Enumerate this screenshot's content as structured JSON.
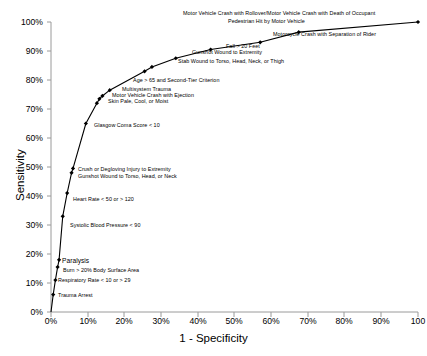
{
  "chart_data": {
    "type": "line",
    "title": "",
    "xlabel": "1 - Specificity",
    "ylabel": "Sensitivity",
    "xlim": [
      0,
      100
    ],
    "ylim": [
      0,
      100
    ],
    "grid": false,
    "legend": "none",
    "xticklabels": [
      "0%",
      "10%",
      "20%",
      "30%",
      "40%",
      "50%",
      "60%",
      "70%",
      "80%",
      "90%",
      "100"
    ],
    "yticklabels": [
      "0%",
      "10%",
      "20%",
      "30%",
      "40%",
      "50%",
      "60%",
      "70%",
      "80%",
      "90%",
      "100%"
    ],
    "series": [
      {
        "name": "ROC curve",
        "marker": "filled-diamond",
        "color": "#000000",
        "points": [
          {
            "x": 0.0,
            "y": 0.0,
            "label": ""
          },
          {
            "x": 0.6,
            "y": 6.0,
            "label": "Trauma Arrest"
          },
          {
            "x": 1.2,
            "y": 11.0,
            "label": "Respiratory Rate < 10 or > 29"
          },
          {
            "x": 1.8,
            "y": 15.5,
            "label": "Burn > 20% Body Surface Area"
          },
          {
            "x": 2.2,
            "y": 18.0,
            "label": "Paralysis"
          },
          {
            "x": 3.2,
            "y": 33.0,
            "label": "Systolic Blood Pressure < 90"
          },
          {
            "x": 4.4,
            "y": 41.0,
            "label": "Heart Rate < 50 or > 120"
          },
          {
            "x": 5.6,
            "y": 48.0,
            "label": "Crush or Degloving Injury to Extremity"
          },
          {
            "x": 6.0,
            "y": 49.5,
            "label": "Gunshot Wound to Torso, Head, or Neck"
          },
          {
            "x": 9.5,
            "y": 65.0,
            "label": "Glasgow Coma Score < 10"
          },
          {
            "x": 12.5,
            "y": 72.0,
            "label": "Skin Pale, Cool, or Moist"
          },
          {
            "x": 13.2,
            "y": 73.5,
            "label": "Motor Vehicle Crash with Ejection"
          },
          {
            "x": 14.0,
            "y": 74.5,
            "label": "Multisystem Trauma"
          },
          {
            "x": 16.0,
            "y": 76.5,
            "label": "Age > 65 and Second-Tier Criterion"
          },
          {
            "x": 25.5,
            "y": 83.0,
            "label": "Stab Wound to Torso, Head, Neck, or Thigh"
          },
          {
            "x": 27.5,
            "y": 84.5,
            "label": "Gunshot Wound to Extremity"
          },
          {
            "x": 34.0,
            "y": 87.5,
            "label": "Fall > 20 Feet"
          },
          {
            "x": 43.5,
            "y": 90.5,
            "label": "Motorcycle Crash with Separation of Rider"
          },
          {
            "x": 57.0,
            "y": 93.0,
            "label": "Pedestrian Hit by Motor Vehicle"
          },
          {
            "x": 67.5,
            "y": 96.5,
            "label": "Motor Vehicle Crash with Rollover/Motor Vehicle Crash with Death of Occupant"
          },
          {
            "x": 100.0,
            "y": 100.0,
            "label": ""
          }
        ]
      }
    ],
    "annotations": [
      {
        "id": "ann-rollover-death",
        "text": "Motor Vehicle Crash with Rollover/Motor Vehicle Crash with Death of Occupant"
      },
      {
        "id": "ann-pedestrian",
        "text": "Pedestrian Hit by Motor Vehicle"
      },
      {
        "id": "ann-motorcycle",
        "text": "Motorcycle Crash with Separation of Rider"
      },
      {
        "id": "ann-fall",
        "text": "Fall > 20 Feet"
      },
      {
        "id": "ann-gunshot-extremity",
        "text": "Gunshot Wound to Extremity"
      },
      {
        "id": "ann-stab",
        "text": "Stab Wound to Torso, Head, Neck, or Thigh"
      },
      {
        "id": "ann-age65",
        "text": "Age > 65 and Second-Tier Criterion"
      },
      {
        "id": "ann-multisystem",
        "text": "Multisystem Trauma"
      },
      {
        "id": "ann-ejection",
        "text": "Motor Vehicle Crash with Ejection"
      },
      {
        "id": "ann-skin",
        "text": "Skin Pale, Cool, or Moist"
      },
      {
        "id": "ann-gcs",
        "text": "Glasgow Coma Score < 10"
      },
      {
        "id": "ann-crush",
        "text": "Crush or Degloving Injury to Extremity"
      },
      {
        "id": "ann-gunshot-torso",
        "text": "Gunshot Wound to Torso, Head, or Neck"
      },
      {
        "id": "ann-heart-rate",
        "text": "Heart Rate < 50 or > 120"
      },
      {
        "id": "ann-sbp",
        "text": "Systolic Blood Pressure < 90"
      },
      {
        "id": "ann-paralysis",
        "text": "Paralysis"
      },
      {
        "id": "ann-burn",
        "text": "Burn > 20% Body Surface Area"
      },
      {
        "id": "ann-resp-rate",
        "text": "Respiratory Rate < 10 or > 29"
      },
      {
        "id": "ann-trauma-arrest",
        "text": "Trauma Arrest"
      }
    ]
  },
  "axes": {
    "x_title": "1 - Specificity",
    "y_title": "Sensitivity",
    "x_ticks": [
      "0%",
      "10%",
      "20%",
      "30%",
      "40%",
      "50%",
      "60%",
      "70%",
      "80%",
      "90%",
      "100"
    ],
    "y_ticks": [
      "100%",
      "90%",
      "80%",
      "70%",
      "60%",
      "50%",
      "40%",
      "30%",
      "20%",
      "10%",
      "0%"
    ]
  }
}
